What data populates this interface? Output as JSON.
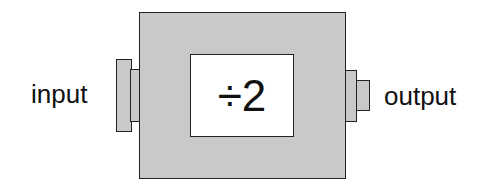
{
  "diagram": {
    "input_label": "input",
    "output_label": "output",
    "operation": "÷2",
    "colors": {
      "box_fill": "#c9c9c9",
      "stroke": "#222222",
      "display_fill": "#ffffff"
    }
  }
}
